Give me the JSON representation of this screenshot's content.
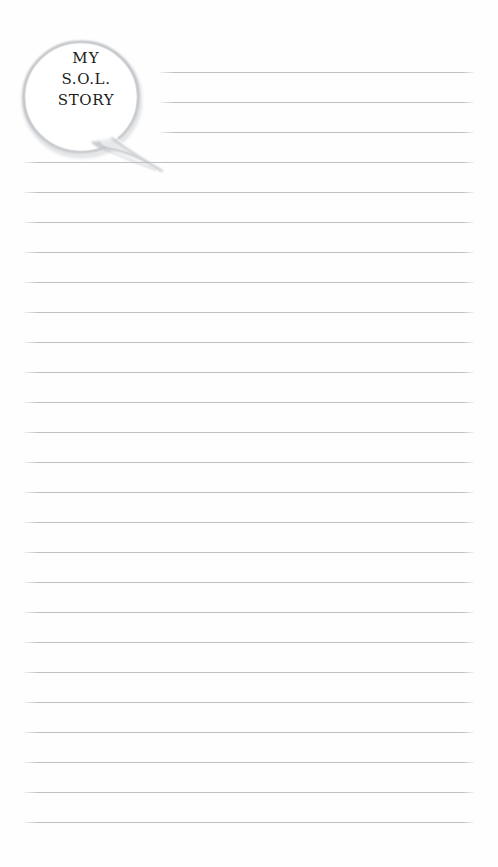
{
  "page": {
    "kind": "lined-worksheet-page",
    "width": 498,
    "height": 867,
    "background_color": "#fefefe"
  },
  "bubble": {
    "icon": "speech-bubble",
    "outline_color": "#b9bcc0",
    "fill_color": "#ffffff",
    "text_color": "#1b1b1b",
    "lines": [
      {
        "text": "MY"
      },
      {
        "text": "S.O.L."
      },
      {
        "text": "STORY"
      }
    ],
    "full_text": "MY S.O.L. STORY"
  },
  "ruled_lines": {
    "color": "#babec2",
    "thickness_px": 1,
    "spacing_px": 30,
    "first_line_y": 72,
    "count": 26,
    "full_left_x": 24,
    "short_left_x": 160,
    "right_x": 474,
    "items": [
      {
        "index": 1,
        "y": 72,
        "left": 160,
        "right": 474,
        "variant": "short"
      },
      {
        "index": 2,
        "y": 102,
        "left": 160,
        "right": 474,
        "variant": "short"
      },
      {
        "index": 3,
        "y": 132,
        "left": 160,
        "right": 474,
        "variant": "short"
      },
      {
        "index": 4,
        "y": 162,
        "left": 24,
        "right": 474,
        "variant": "full"
      },
      {
        "index": 5,
        "y": 192,
        "left": 24,
        "right": 474,
        "variant": "full"
      },
      {
        "index": 6,
        "y": 222,
        "left": 24,
        "right": 474,
        "variant": "full"
      },
      {
        "index": 7,
        "y": 252,
        "left": 24,
        "right": 474,
        "variant": "full"
      },
      {
        "index": 8,
        "y": 282,
        "left": 24,
        "right": 474,
        "variant": "full"
      },
      {
        "index": 9,
        "y": 312,
        "left": 24,
        "right": 474,
        "variant": "full"
      },
      {
        "index": 10,
        "y": 342,
        "left": 24,
        "right": 474,
        "variant": "full"
      },
      {
        "index": 11,
        "y": 372,
        "left": 24,
        "right": 474,
        "variant": "full"
      },
      {
        "index": 12,
        "y": 402,
        "left": 24,
        "right": 474,
        "variant": "full"
      },
      {
        "index": 13,
        "y": 432,
        "left": 24,
        "right": 474,
        "variant": "full"
      },
      {
        "index": 14,
        "y": 462,
        "left": 24,
        "right": 474,
        "variant": "full"
      },
      {
        "index": 15,
        "y": 492,
        "left": 24,
        "right": 474,
        "variant": "full"
      },
      {
        "index": 16,
        "y": 522,
        "left": 24,
        "right": 474,
        "variant": "full"
      },
      {
        "index": 17,
        "y": 552,
        "left": 24,
        "right": 474,
        "variant": "full"
      },
      {
        "index": 18,
        "y": 582,
        "left": 24,
        "right": 474,
        "variant": "full"
      },
      {
        "index": 19,
        "y": 612,
        "left": 24,
        "right": 474,
        "variant": "full"
      },
      {
        "index": 20,
        "y": 642,
        "left": 24,
        "right": 474,
        "variant": "full"
      },
      {
        "index": 21,
        "y": 672,
        "left": 24,
        "right": 474,
        "variant": "full"
      },
      {
        "index": 22,
        "y": 702,
        "left": 24,
        "right": 474,
        "variant": "full"
      },
      {
        "index": 23,
        "y": 732,
        "left": 24,
        "right": 474,
        "variant": "full"
      },
      {
        "index": 24,
        "y": 762,
        "left": 24,
        "right": 474,
        "variant": "full"
      },
      {
        "index": 25,
        "y": 792,
        "left": 24,
        "right": 474,
        "variant": "full"
      },
      {
        "index": 26,
        "y": 822,
        "left": 24,
        "right": 474,
        "variant": "full"
      }
    ]
  }
}
